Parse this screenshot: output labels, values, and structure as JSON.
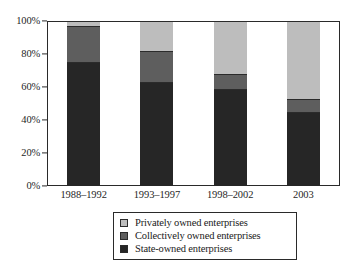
{
  "chart_data": {
    "type": "bar",
    "subtype": "stacked-percentage",
    "title": "",
    "xlabel": "",
    "ylabel": "",
    "ylim": [
      0,
      100
    ],
    "grid": false,
    "legend_position": "bottom-center",
    "categories": [
      "1988–1992",
      "1993–1997",
      "1998–2002",
      "2003"
    ],
    "series": [
      {
        "name": "State-owned enterprises",
        "color": "#262626",
        "values": [
          75,
          63,
          59,
          45
        ]
      },
      {
        "name": "Collectively owned enterprises",
        "color": "#5e5e5e",
        "values": [
          22,
          19,
          9,
          8
        ]
      },
      {
        "name": "Privately owned enterprises",
        "color": "#bdbdbd",
        "values": [
          3,
          18,
          32,
          47
        ]
      }
    ],
    "y_ticks": [
      {
        "value": 100,
        "label": "100%"
      },
      {
        "value": 80,
        "label": "80%"
      },
      {
        "value": 60,
        "label": "60%"
      },
      {
        "value": 40,
        "label": "40%"
      },
      {
        "value": 20,
        "label": "20%"
      },
      {
        "value": 0,
        "label": "0%"
      }
    ],
    "legend_entries": [
      {
        "label": "Privately owned enterprises",
        "color": "#bdbdbd"
      },
      {
        "label": "Collectively owned enterprises",
        "color": "#5e5e5e"
      },
      {
        "label": "State-owned enterprises",
        "color": "#262626"
      }
    ]
  },
  "axes": {
    "y_tick_labels": [
      "100%",
      "80%",
      "60%",
      "40%",
      "20%",
      "0%"
    ],
    "x_tick_labels": [
      "1988–1992",
      "1993–1997",
      "1998–2002",
      "2003"
    ]
  },
  "legend": {
    "rows": [
      {
        "label": "Privately owned enterprises"
      },
      {
        "label": "Collectively owned enterprises"
      },
      {
        "label": "State-owned enterprises"
      }
    ]
  },
  "caption": {
    "partial_text": ""
  },
  "colors": {
    "state_owned": "#262626",
    "collectively_owned": "#5e5e5e",
    "privately_owned": "#bdbdbd",
    "frame": "#2a2a2a",
    "background": "#ffffff"
  }
}
